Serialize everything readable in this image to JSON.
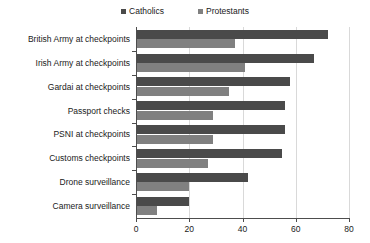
{
  "chart_data": {
    "type": "bar",
    "orientation": "horizontal",
    "title": "",
    "subtitle": "",
    "xlabel": "",
    "ylabel": "",
    "xlim": [
      0,
      80
    ],
    "xticks": [
      0,
      20,
      40,
      60,
      80
    ],
    "grid": true,
    "legend_position": "top-center",
    "categories": [
      "British Army at checkpoints",
      "Irish Army at checkpoints",
      "Gardai at checkpoints",
      "Passport checks",
      "PSNI at checkpoints",
      "Customs checkpoints",
      "Drone surveillance",
      "Camera surveillance"
    ],
    "series": [
      {
        "name": "Catholics",
        "color": "#4a4a4a",
        "values": [
          72,
          67,
          58,
          56,
          56,
          55,
          42,
          20
        ]
      },
      {
        "name": "Protestants",
        "color": "#808080",
        "values": [
          37,
          41,
          35,
          29,
          29,
          27,
          20,
          8
        ]
      }
    ]
  },
  "legend": {
    "entries": [
      {
        "label": "Catholics",
        "color": "#4a4a4a"
      },
      {
        "label": "Protestants",
        "color": "#808080"
      }
    ]
  },
  "axis": {
    "x_tick_labels": [
      "0",
      "20",
      "40",
      "60",
      "80"
    ]
  },
  "colors": {
    "axis": "#4d4d4d",
    "grid": "#d9d9d9",
    "text": "#1a1a1a",
    "background": "#ffffff"
  }
}
